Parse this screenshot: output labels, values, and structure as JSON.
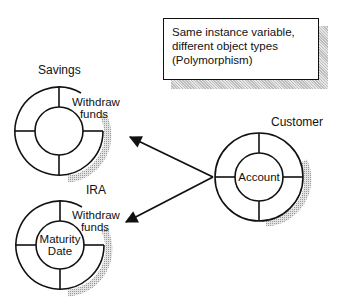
{
  "note": {
    "lines": [
      "Same instance variable,",
      "different object types",
      "(Polymorphism)"
    ]
  },
  "objects": [
    {
      "id": "savings",
      "title": "Savings",
      "method": [
        "Withdraw",
        "funds"
      ],
      "core": ""
    },
    {
      "id": "ira",
      "title": "IRA",
      "method": [
        "Withdraw",
        "funds"
      ],
      "core_lines": [
        "Maturity",
        "Date"
      ]
    },
    {
      "id": "customer",
      "title": "Customer",
      "core": "Account"
    }
  ],
  "colors": {
    "stroke": "#111111",
    "shadow": "#bdbdbd",
    "background": "#ffffff"
  }
}
